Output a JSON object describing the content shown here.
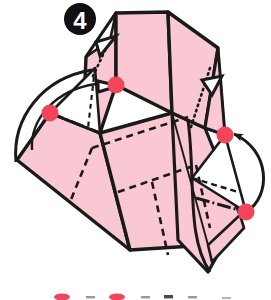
{
  "figure": {
    "kind": "origami-fold-diagram",
    "step_label": "4",
    "step_badge_name": "step-number-badge"
  },
  "palette": {
    "paper_front": "#f9c8d2",
    "paper_back": "#ffffff",
    "outline": "#1a1a1a",
    "fold_line": "#1a1a1a",
    "marker_red": "#f0455a",
    "marker_red_dark": "#d0203a",
    "badge_bg": "#111111",
    "badge_text": "#ffffff",
    "page_bg": "#ffffff"
  },
  "markers": {
    "label": "reference point markers",
    "dots": [
      {
        "name": "marker-dot-top-left",
        "cx": 116,
        "cy": 85,
        "r": 8.5
      },
      {
        "name": "marker-dot-left",
        "cx": 50,
        "cy": 113,
        "r": 8.5
      },
      {
        "name": "marker-dot-right",
        "cx": 225,
        "cy": 135,
        "r": 8.5
      },
      {
        "name": "marker-dot-bottom-right",
        "cx": 246,
        "cy": 212,
        "r": 8.5
      }
    ]
  },
  "arrows": {
    "label": "fold direction arrows",
    "items": [
      {
        "name": "fold-arrow-right-curved",
        "direction": "left",
        "style": "solid-head"
      },
      {
        "name": "fold-arrow-left-curved",
        "direction": "right",
        "style": "open"
      }
    ]
  },
  "fold_lines": {
    "valley_style": "dashed",
    "mountain_style": "dash-dot",
    "hidden_style": "dotted",
    "edge_style": "solid"
  },
  "legend": {
    "name": "legend-strip",
    "visible": "partially-cropped",
    "items": [
      {
        "name": "legend-dot-1",
        "type": "red-dot"
      },
      {
        "name": "legend-mark-1",
        "type": "tick"
      },
      {
        "name": "legend-dot-2",
        "type": "red-dot"
      },
      {
        "name": "legend-mark-2",
        "type": "tick"
      },
      {
        "name": "legend-mark-3",
        "type": "tick"
      },
      {
        "name": "legend-mark-4",
        "type": "tick"
      },
      {
        "name": "legend-mark-5",
        "type": "tick"
      }
    ]
  }
}
